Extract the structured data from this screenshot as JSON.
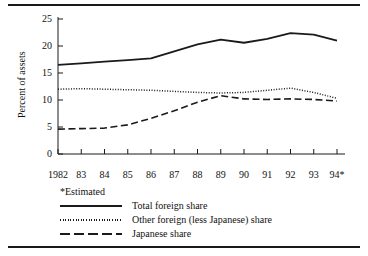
{
  "figure": {
    "footnote": "*Estimated",
    "rules": {
      "top": "horizontal-rule",
      "bottom": "horizontal-rule"
    }
  },
  "chart_data": {
    "type": "line",
    "title": "",
    "xlabel": "",
    "ylabel": "Percent of assets",
    "xlim": [
      1982,
      1994
    ],
    "ylim": [
      0,
      25
    ],
    "yticks": [
      0,
      5,
      10,
      15,
      20,
      25
    ],
    "ytick_labels": [
      "0",
      "5",
      "10",
      "15",
      "20",
      "25"
    ],
    "x": [
      1982,
      1983,
      1984,
      1985,
      1986,
      1987,
      1988,
      1989,
      1990,
      1991,
      1992,
      1993,
      1994
    ],
    "xtick_labels": [
      "1982",
      "83",
      "84",
      "85",
      "86",
      "87",
      "88",
      "89",
      "90",
      "91",
      "92",
      "93",
      "94*"
    ],
    "grid": false,
    "legend_position": "below-axes-left",
    "series": [
      {
        "name": "Total foreign share",
        "style": "solid",
        "color": "#1a1a1a",
        "values": [
          16.5,
          16.8,
          17.1,
          17.4,
          17.7,
          19.0,
          20.3,
          21.2,
          20.6,
          21.3,
          22.4,
          22.1,
          21.0
        ]
      },
      {
        "name": "Other foreign (less Japanese) share",
        "style": "dotted",
        "color": "#1a1a1a",
        "values": [
          12.0,
          12.1,
          12.0,
          11.9,
          11.8,
          11.6,
          11.4,
          11.3,
          11.4,
          11.8,
          12.2,
          11.4,
          10.3
        ]
      },
      {
        "name": "Japanese share",
        "style": "dashed",
        "color": "#1a1a1a",
        "values": [
          4.6,
          4.7,
          4.8,
          5.4,
          6.6,
          8.0,
          9.6,
          10.8,
          10.2,
          10.1,
          10.2,
          10.1,
          9.8
        ]
      }
    ]
  }
}
